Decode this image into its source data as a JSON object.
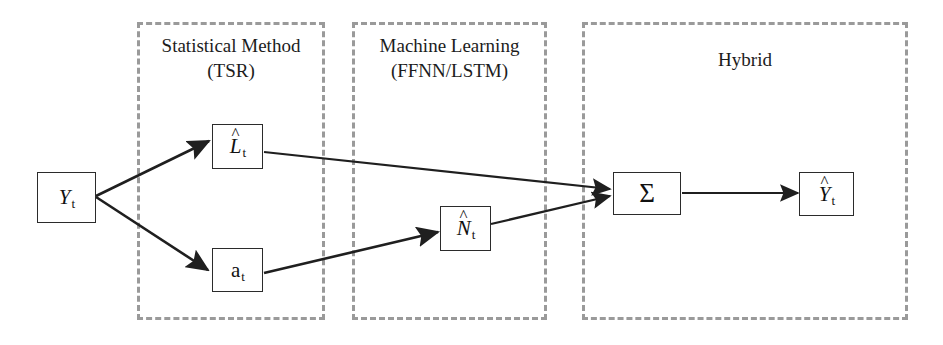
{
  "diagram": {
    "background_color": "#ffffff",
    "stroke_color": "#2b2b2b",
    "dashed_border_color": "#9a9a9a",
    "groups": [
      {
        "id": "statistical-method",
        "label_line1": "Statistical Method",
        "label_line2": "(TSR)",
        "label": "Statistical Method\n(TSR)"
      },
      {
        "id": "machine-learning",
        "label_line1": "Machine Learning",
        "label_line2": "(FFNN/LSTM)",
        "label": "Machine Learning\n(FFNN/LSTM)"
      },
      {
        "id": "hybrid",
        "label_line1": "Hybrid",
        "label_line2": "",
        "label": "Hybrid"
      }
    ],
    "nodes": [
      {
        "id": "input",
        "base": "Y",
        "hat": "",
        "subscript": "t",
        "text": "Yt"
      },
      {
        "id": "linear",
        "base": "L",
        "hat": "^",
        "subscript": "t",
        "text": "L̂t"
      },
      {
        "id": "residual",
        "base": "a",
        "hat": "",
        "subscript": "t",
        "text": "at"
      },
      {
        "id": "nonlinear",
        "base": "N",
        "hat": "^",
        "subscript": "t",
        "text": "N̂t"
      },
      {
        "id": "sum",
        "base": "Σ",
        "hat": "",
        "subscript": "",
        "text": "Σ"
      },
      {
        "id": "output",
        "base": "Y",
        "hat": "^",
        "subscript": "t",
        "text": "Ŷt"
      }
    ],
    "edges": [
      {
        "id": "input-to-linear",
        "from": "input",
        "to": "linear"
      },
      {
        "id": "input-to-residual",
        "from": "input",
        "to": "residual"
      },
      {
        "id": "linear-to-sum",
        "from": "linear",
        "to": "sum"
      },
      {
        "id": "residual-to-nonlinear",
        "from": "residual",
        "to": "nonlinear"
      },
      {
        "id": "nonlinear-to-sum",
        "from": "nonlinear",
        "to": "sum"
      },
      {
        "id": "sum-to-output",
        "from": "sum",
        "to": "output"
      }
    ]
  }
}
